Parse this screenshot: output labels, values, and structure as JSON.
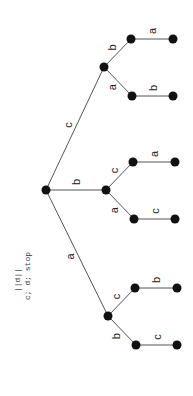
{
  "caption": {
    "line1": "||d||",
    "line2": "c; d; stop"
  },
  "tree": {
    "root": {
      "id": "r",
      "x": 46,
      "y": 190
    },
    "nodes": [
      {
        "id": "c",
        "x": 104,
        "y": 67
      },
      {
        "id": "cb",
        "x": 131,
        "y": 39
      },
      {
        "id": "cba",
        "x": 173,
        "y": 39
      },
      {
        "id": "ca",
        "x": 132,
        "y": 96
      },
      {
        "id": "cab",
        "x": 173,
        "y": 96
      },
      {
        "id": "b",
        "x": 106,
        "y": 190
      },
      {
        "id": "bc",
        "x": 133,
        "y": 162
      },
      {
        "id": "bca",
        "x": 175,
        "y": 162
      },
      {
        "id": "ba",
        "x": 134,
        "y": 219
      },
      {
        "id": "bac",
        "x": 175,
        "y": 219
      },
      {
        "id": "a",
        "x": 108,
        "y": 316
      },
      {
        "id": "ac",
        "x": 135,
        "y": 288
      },
      {
        "id": "acb",
        "x": 177,
        "y": 288
      },
      {
        "id": "ab",
        "x": 136,
        "y": 345
      },
      {
        "id": "abc",
        "x": 177,
        "y": 345
      }
    ],
    "edges": [
      {
        "from": "r",
        "to": "c",
        "label": "c"
      },
      {
        "from": "c",
        "to": "cb",
        "label": "b"
      },
      {
        "from": "cb",
        "to": "cba",
        "label": "a"
      },
      {
        "from": "c",
        "to": "ca",
        "label": "a"
      },
      {
        "from": "ca",
        "to": "cab",
        "label": "b"
      },
      {
        "from": "r",
        "to": "b",
        "label": "b"
      },
      {
        "from": "b",
        "to": "bc",
        "label": "c"
      },
      {
        "from": "bc",
        "to": "bca",
        "label": "a"
      },
      {
        "from": "b",
        "to": "ba",
        "label": "a"
      },
      {
        "from": "ba",
        "to": "bac",
        "label": "c"
      },
      {
        "from": "r",
        "to": "a",
        "label": "a"
      },
      {
        "from": "a",
        "to": "ac",
        "label": "c"
      },
      {
        "from": "ac",
        "to": "acb",
        "label": "b"
      },
      {
        "from": "a",
        "to": "ab",
        "label": "b"
      },
      {
        "from": "ab",
        "to": "abc",
        "label": "c"
      }
    ]
  }
}
